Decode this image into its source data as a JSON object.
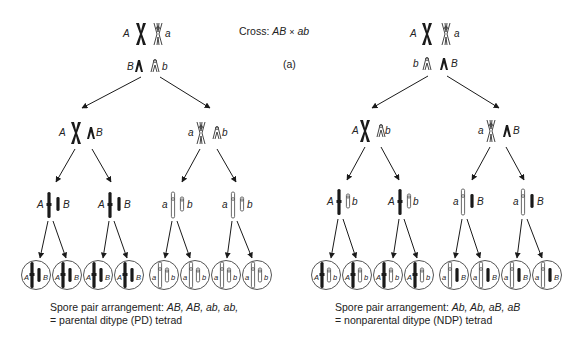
{
  "header": {
    "cross_prefix": "Cross: ",
    "cross_genotype_1": "AB",
    "cross_symbol": "×",
    "cross_genotype_2": "ab",
    "panel_label": "(a)"
  },
  "left_tree": {
    "parent_pair_1": {
      "left": "A",
      "right": "a"
    },
    "parent_pair_2": {
      "left": "B",
      "right": "b"
    },
    "meiosis1": [
      {
        "left": "A",
        "right": "B"
      },
      {
        "left": "a",
        "right": "b"
      }
    ],
    "meiosis2": [
      {
        "left": "A",
        "right": "B"
      },
      {
        "left": "A",
        "right": "B"
      },
      {
        "left": "a",
        "right": "b"
      },
      {
        "left": "a",
        "right": "b"
      }
    ],
    "spores": [
      {
        "left": "A",
        "right": "B"
      },
      {
        "left": "A",
        "right": "B"
      },
      {
        "left": "A",
        "right": "B"
      },
      {
        "left": "A",
        "right": "B"
      },
      {
        "left": "a",
        "right": "b"
      },
      {
        "left": "a",
        "right": "b"
      },
      {
        "left": "a",
        "right": "b"
      },
      {
        "left": "a",
        "right": "b"
      }
    ],
    "caption_prefix": "Spore pair arrangement: ",
    "caption_values": "AB, AB, ab, ab,",
    "caption_line2": "= parental ditype (PD) tetrad"
  },
  "right_tree": {
    "parent_pair_1": {
      "left": "A",
      "right": "a"
    },
    "parent_pair_2": {
      "left": "b",
      "right": "B"
    },
    "meiosis1": [
      {
        "left": "A",
        "right": "b"
      },
      {
        "left": "a",
        "right": "B"
      }
    ],
    "meiosis2": [
      {
        "left": "A",
        "right": "b"
      },
      {
        "left": "A",
        "right": "b"
      },
      {
        "left": "a",
        "right": "B"
      },
      {
        "left": "a",
        "right": "B"
      }
    ],
    "spores": [
      {
        "left": "A",
        "right": "b"
      },
      {
        "left": "A",
        "right": "b"
      },
      {
        "left": "A",
        "right": "b"
      },
      {
        "left": "A",
        "right": "b"
      },
      {
        "left": "a",
        "right": "B"
      },
      {
        "left": "a",
        "right": "B"
      },
      {
        "left": "a",
        "right": "B"
      },
      {
        "left": "a",
        "right": "B"
      }
    ],
    "caption_prefix": "Spore pair arrangement: ",
    "caption_values": "Ab, Ab, aB, aB",
    "caption_line2": "= nonparental ditype (NDP) tetrad"
  },
  "colors": {
    "ink": "#1a1a1a",
    "outline_chromosome": "#555555",
    "background": "#ffffff"
  }
}
